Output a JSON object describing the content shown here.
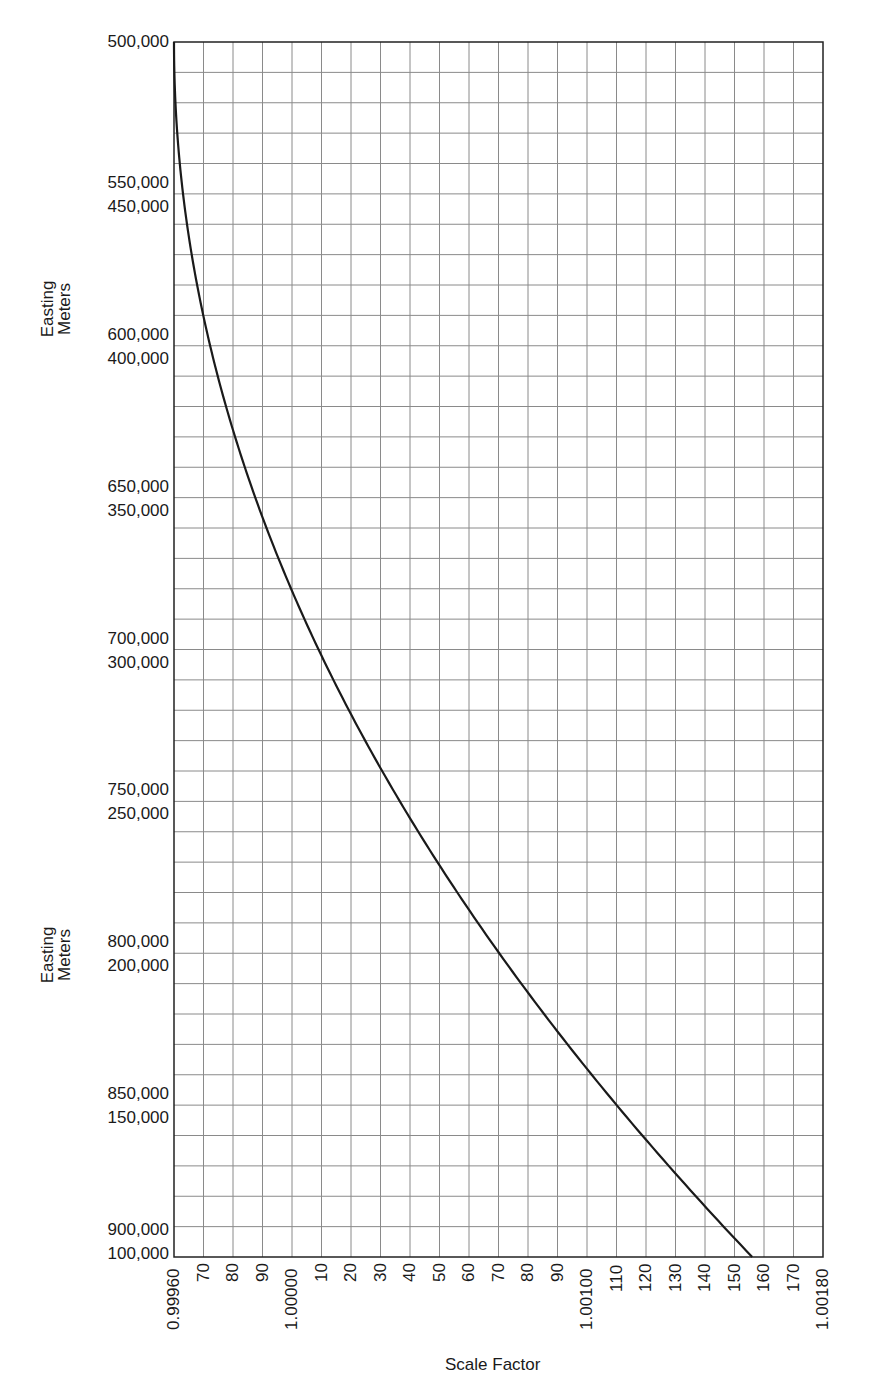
{
  "chart_data": {
    "type": "line",
    "title": "",
    "xlabel": "Scale Factor",
    "ylabel": "Easting Meters",
    "xlim": [
      0.9996,
      1.0018
    ],
    "ylim_left_primary": [
      500000,
      900000
    ],
    "ylim_left_secondary": [
      500000,
      100000
    ],
    "grid": true,
    "grid_x_step": 0.0001,
    "grid_y_step": 10000,
    "x_tick_labels": [
      "0.99960",
      "70",
      "80",
      "90",
      "1.00000",
      "10",
      "20",
      "30",
      "40",
      "50",
      "60",
      "70",
      "80",
      "90",
      "1.00100",
      "110",
      "120",
      "130",
      "140",
      "150",
      "160",
      "170",
      "1.00180"
    ],
    "y_tick_labels": [
      {
        "upper": "500,000",
        "lower": null
      },
      {
        "upper": "550,000",
        "lower": "450,000"
      },
      {
        "upper": "600,000",
        "lower": "400,000"
      },
      {
        "upper": "650,000",
        "lower": "350,000"
      },
      {
        "upper": "700,000",
        "lower": "300,000"
      },
      {
        "upper": "750,000",
        "lower": "250,000"
      },
      {
        "upper": "800,000",
        "lower": "200,000"
      },
      {
        "upper": "850,000",
        "lower": "150,000"
      },
      {
        "upper": "900,000",
        "lower": "100,000"
      }
    ],
    "y_axis_titles": [
      "Easting Meters",
      "Easting Meters"
    ],
    "series": [
      {
        "name": "UTM scale factor vs. easting",
        "distance_from_central_meridian_m": [
          0,
          50000,
          100000,
          150000,
          200000,
          250000,
          300000,
          350000,
          400000
        ],
        "easting_east_m": [
          500000,
          550000,
          600000,
          650000,
          700000,
          750000,
          800000,
          850000,
          900000
        ],
        "easting_west_m": [
          500000,
          450000,
          400000,
          350000,
          300000,
          250000,
          200000,
          150000,
          100000
        ],
        "scale_factor": [
          0.9996,
          0.99963,
          0.99972,
          0.99988,
          1.00009,
          1.00037,
          1.0007,
          1.0011,
          1.00156
        ]
      }
    ]
  },
  "labels": {
    "y_title_1": "Easting\nMeters",
    "y_title_1_line1": "Easting",
    "y_title_1_line2": "Meters",
    "y_title_2_line1": "Easting",
    "y_title_2_line2": "Meters",
    "x_title": "Scale Factor"
  },
  "style": {
    "grid_color": "#8a8a8a",
    "axis_color": "#222222",
    "curve_color": "#1a1a1a"
  }
}
